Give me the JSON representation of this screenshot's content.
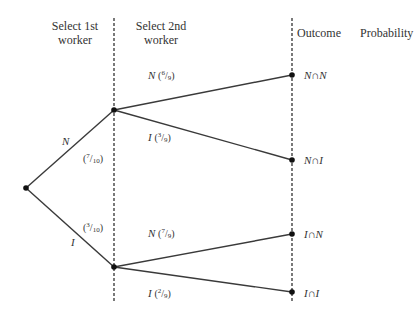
{
  "headers": {
    "stage1": "Select 1st worker",
    "stage1_line1": "Select 1st",
    "stage1_line2": "worker",
    "stage2_line1": "Select 2nd",
    "stage2_line2": "worker",
    "outcome": "Outcome",
    "probability": "Probability"
  },
  "branches": {
    "first": [
      {
        "label": "N",
        "prob_num": "7",
        "prob_den": "10"
      },
      {
        "label": "I",
        "prob_num": "3",
        "prob_den": "10"
      }
    ],
    "second": [
      {
        "label": "N",
        "prob_num": "6",
        "prob_den": "9"
      },
      {
        "label": "I",
        "prob_num": "3",
        "prob_den": "9"
      },
      {
        "label": "N",
        "prob_num": "7",
        "prob_den": "9"
      },
      {
        "label": "I",
        "prob_num": "2",
        "prob_den": "9"
      }
    ]
  },
  "outcomes": [
    {
      "label": "N∩N",
      "f1_num": "7",
      "f1_den": "10",
      "f2_num": "6",
      "f2_den": "9",
      "res_num": "42",
      "res_den": "90"
    },
    {
      "label": "N∩I",
      "f1_num": "7",
      "f1_den": "10",
      "f2_num": "3",
      "f2_den": "9",
      "res_num": "21",
      "res_den": "90"
    },
    {
      "label": "I∩N",
      "f1_num": "3",
      "f1_den": "10",
      "f2_num": "7",
      "f2_den": "9",
      "res_num": "21",
      "res_den": "90"
    },
    {
      "label": "I∩I",
      "f1_num": "3",
      "f1_den": "10",
      "f2_num": "2",
      "f2_den": "9",
      "res_num": "6",
      "res_den": "90"
    }
  ],
  "symbols": {
    "lparen": "(",
    "rparen": ")",
    "equals": "=",
    "slash": "/",
    "open": "(",
    "close": ")"
  },
  "colors": {
    "line": "#3a3a3a",
    "text": "#333333",
    "background": "#ffffff"
  }
}
